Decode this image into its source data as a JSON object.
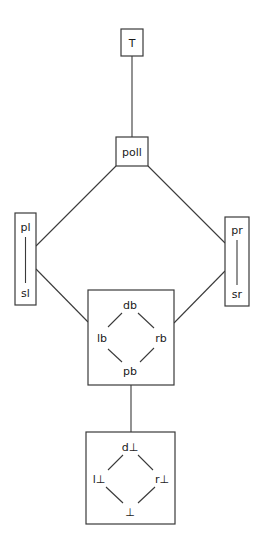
{
  "diagram": {
    "type": "lattice",
    "nodes": {
      "top": {
        "label": "T"
      },
      "poll": {
        "label": "poll"
      },
      "left_group": {
        "upper": "pl",
        "lower": "sl"
      },
      "right_group": {
        "upper": "pr",
        "lower": "sr"
      },
      "b_group": {
        "top": "db",
        "left": "lb",
        "right": "rb",
        "bottom": "pb"
      },
      "bot_group": {
        "top": "d⊥",
        "left": "l⊥",
        "right": "r⊥",
        "bottom": "⊥"
      }
    },
    "edges": [
      [
        "T",
        "poll"
      ],
      [
        "poll",
        "pl/sl"
      ],
      [
        "poll",
        "pr/sr"
      ],
      [
        "pl/sl",
        "db/lb/rb/pb"
      ],
      [
        "pr/sr",
        "db/lb/rb/pb"
      ],
      [
        "db/lb/rb/pb",
        "d⊥/l⊥/r⊥/⊥"
      ],
      [
        "pl",
        "sl"
      ],
      [
        "pr",
        "sr"
      ],
      [
        "db",
        "lb"
      ],
      [
        "db",
        "rb"
      ],
      [
        "lb",
        "pb"
      ],
      [
        "rb",
        "pb"
      ],
      [
        "d⊥",
        "l⊥"
      ],
      [
        "d⊥",
        "r⊥"
      ],
      [
        "l⊥",
        "⊥"
      ],
      [
        "r⊥",
        "⊥"
      ]
    ]
  }
}
